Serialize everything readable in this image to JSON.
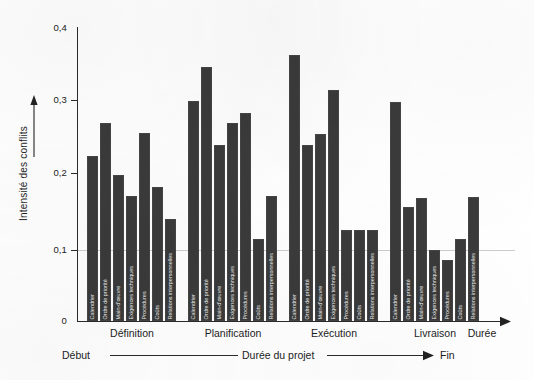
{
  "chart_data": {
    "type": "bar",
    "title": "",
    "xlabel": "Durée",
    "ylabel": "Intensité des conflits",
    "ylim": [
      0,
      0.4
    ],
    "ytick_labels": [
      "0,4",
      "0,3",
      "0,2",
      "0,1",
      "0"
    ],
    "ytick_values": [
      0.4,
      0.3,
      0.2,
      0.1,
      0
    ],
    "grid": "single horizontal gridline at 0,1",
    "legend": "none",
    "categories": [
      "Calendrier",
      "Ordre de priorité",
      "Main-d'œuvre",
      "Exigences techniques",
      "Procédures",
      "Coûts",
      "Relations interpersonnelles"
    ],
    "groups": [
      {
        "name": "Définition",
        "values": [
          0.225,
          0.27,
          0.198,
          0.17,
          0.256,
          0.182,
          0.139
        ]
      },
      {
        "name": "Planification",
        "values": [
          0.299,
          0.345,
          0.24,
          0.27,
          0.283,
          0.111,
          0.17
        ]
      },
      {
        "name": "Exécution",
        "values": [
          0.362,
          0.24,
          0.255,
          0.314,
          0.124,
          0.124,
          0.124
        ]
      },
      {
        "name": "Livraison",
        "values": [
          0.298,
          0.155,
          0.168,
          0.096,
          0.083,
          0.112,
          0.169
        ]
      }
    ],
    "axis_annotation": {
      "start": "Début",
      "middle": "Durée du projet",
      "end": "Fin"
    },
    "colors": {
      "bar": "#3a3a3a",
      "axis": "#2a2a2a",
      "gridline": "#8a8a8a",
      "background": "#ffffff",
      "bar_label_text": "#e8e8e8"
    }
  }
}
